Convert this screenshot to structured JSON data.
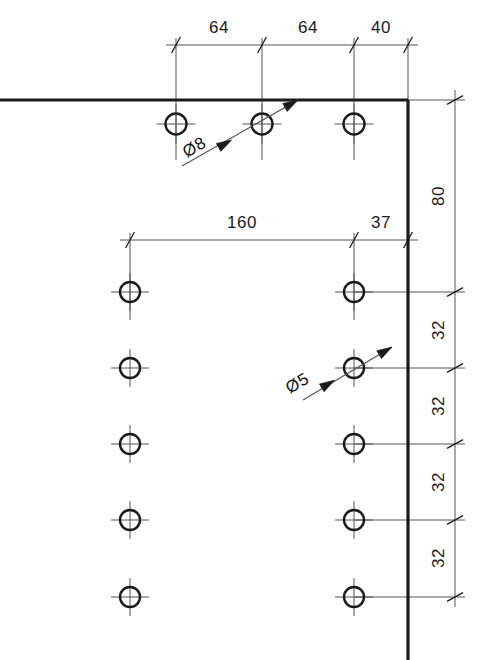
{
  "drawing": {
    "type": "engineering-hole-pattern-detail",
    "background_color": "#ffffff",
    "line_color": "#1a1a1a",
    "thin_line_color": "#555555",
    "object_line_width": 3.2,
    "thin_line_width": 1.0,
    "units_note": "",
    "horizontal_dimensions": {
      "top_row": {
        "dim_line_y": 45,
        "segments": [
          {
            "label": "64",
            "x_start": 176,
            "x_end": 262,
            "text_x": 219,
            "text_y": 33
          },
          {
            "label": "64",
            "x_start": 262,
            "x_end": 354,
            "text_x": 308,
            "text_y": 33
          },
          {
            "label": "40",
            "x_start": 354,
            "x_end": 408,
            "text_x": 381,
            "text_y": 33
          }
        ]
      },
      "middle_row": {
        "dim_line_y": 240,
        "segments": [
          {
            "label": "160",
            "x_start": 130,
            "x_end": 354,
            "text_x": 242,
            "text_y": 228
          },
          {
            "label": "37",
            "x_start": 354,
            "x_end": 408,
            "text_x": 381,
            "text_y": 228
          }
        ]
      }
    },
    "vertical_dimensions": {
      "dim_line_x": 455,
      "segments": [
        {
          "label": "80",
          "y_start": 100,
          "y_end": 292,
          "text_x": 444,
          "text_y": 196
        },
        {
          "label": "32",
          "y_start": 292,
          "y_end": 368,
          "text_x": 444,
          "text_y": 330
        },
        {
          "label": "32",
          "y_start": 368,
          "y_end": 444,
          "text_x": 444,
          "text_y": 406
        },
        {
          "label": "32",
          "y_start": 444,
          "y_end": 520,
          "text_x": 444,
          "text_y": 482
        },
        {
          "label": "32",
          "y_start": 520,
          "y_end": 597,
          "text_x": 444,
          "text_y": 558
        }
      ]
    },
    "object_lines": [
      {
        "name": "top-edge",
        "x1": 0,
        "y1": 100,
        "x2": 408,
        "y2": 100
      },
      {
        "name": "right-edge",
        "x1": 408,
        "y1": 100,
        "x2": 408,
        "y2": 660
      }
    ],
    "holes": [
      {
        "id": "h1",
        "cx": 176,
        "cy": 124,
        "r": 10.5,
        "dia": "8"
      },
      {
        "id": "h2",
        "cx": 262,
        "cy": 124,
        "r": 10.5,
        "dia": "8"
      },
      {
        "id": "h3",
        "cx": 354,
        "cy": 124,
        "r": 10.5,
        "dia": "8"
      },
      {
        "id": "h4",
        "cx": 130,
        "cy": 292,
        "r": 10.0,
        "dia": "5"
      },
      {
        "id": "h5",
        "cx": 354,
        "cy": 292,
        "r": 10.0,
        "dia": "5"
      },
      {
        "id": "h6",
        "cx": 130,
        "cy": 368,
        "r": 10.0,
        "dia": "5"
      },
      {
        "id": "h7",
        "cx": 354,
        "cy": 368,
        "r": 10.0,
        "dia": "5"
      },
      {
        "id": "h8",
        "cx": 130,
        "cy": 444,
        "r": 10.0,
        "dia": "5"
      },
      {
        "id": "h9",
        "cx": 354,
        "cy": 444,
        "r": 10.0,
        "dia": "5"
      },
      {
        "id": "h10",
        "cx": 130,
        "cy": 520,
        "r": 10.0,
        "dia": "5"
      },
      {
        "id": "h11",
        "cx": 354,
        "cy": 520,
        "r": 10.0,
        "dia": "5"
      },
      {
        "id": "h12",
        "cx": 130,
        "cy": 597,
        "r": 10.0,
        "dia": "5"
      },
      {
        "id": "h13",
        "cx": 354,
        "cy": 597,
        "r": 10.0,
        "dia": "5"
      }
    ],
    "diameter_callouts": [
      {
        "id": "dia-8",
        "label": "Ø8",
        "text_x": 197,
        "text_y": 152,
        "rotate": -30,
        "leader_x1": 182,
        "leader_y1": 166,
        "leader_x2": 298,
        "leader_y2": 100,
        "target_cx": 262,
        "target_cy": 124
      },
      {
        "id": "dia-5",
        "label": "Ø5",
        "text_x": 300,
        "text_y": 388,
        "rotate": -30,
        "leader_x1": 303,
        "leader_y1": 400,
        "leader_x2": 392,
        "leader_y2": 347,
        "target_cx": 354,
        "target_cy": 368
      }
    ]
  }
}
